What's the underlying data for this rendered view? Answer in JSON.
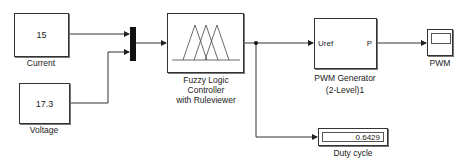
{
  "blocks": {
    "current": {
      "value": "15",
      "label": "Current"
    },
    "voltage": {
      "value": "17.3",
      "label": "Voltage"
    },
    "fuzzy": {
      "label_lines": [
        "Fuzzy Logic",
        "Controller",
        "with Ruleviewer"
      ]
    },
    "pwm_gen": {
      "in_port": "Uref",
      "out_port": "P",
      "label_lines": [
        "PWM Generator",
        "(2-Level)1"
      ]
    },
    "scope": {
      "label": "PWM"
    },
    "display": {
      "value": "0.6429",
      "label": "Duty cycle"
    }
  },
  "colors": {
    "line": "#333333",
    "mux": "#111111",
    "background": "#ffffff"
  }
}
